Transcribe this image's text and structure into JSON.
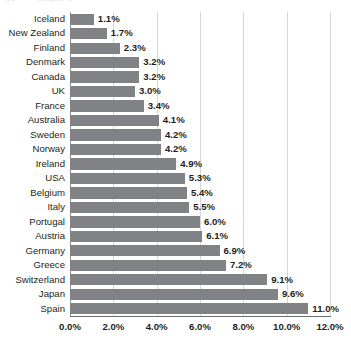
{
  "page": {
    "ghost_header_number": "16",
    "ghost_header_text": "Chapter 2"
  },
  "chart_data": {
    "type": "bar",
    "orientation": "horizontal",
    "title": "",
    "subtitle": "",
    "xlabel": "",
    "ylabel": "",
    "xlim": [
      0,
      12
    ],
    "xtick_labels": [
      "0.0%",
      "2.0%",
      "4.0%",
      "6.0%",
      "8.0%",
      "10.0%",
      "12.0%"
    ],
    "xtick_values": [
      0,
      2,
      4,
      6,
      8,
      10,
      12
    ],
    "grid": "vertical",
    "legend": "none",
    "bar_color": "#808285",
    "gridline_color": "#d5d7d8",
    "axis_color": "#6d7072",
    "value_label_suffix": "%",
    "categories": [
      "Iceland",
      "New Zealand",
      "Finland",
      "Denmark",
      "Canada",
      "UK",
      "France",
      "Australia",
      "Sweden",
      "Norway",
      "Ireland",
      "USA",
      "Belgium",
      "Italy",
      "Portugal",
      "Austria",
      "Germany",
      "Greece",
      "Switzerland",
      "Japan",
      "Spain"
    ],
    "values": [
      1.1,
      1.7,
      2.3,
      3.2,
      3.2,
      3.0,
      3.4,
      4.1,
      4.2,
      4.2,
      4.9,
      5.3,
      5.4,
      5.5,
      6.0,
      6.1,
      6.9,
      7.2,
      9.1,
      9.6,
      11.0
    ],
    "data_labels": [
      "1.1%",
      "1.7%",
      "2.3%",
      "3.2%",
      "3.2%",
      "3.0%",
      "3.4%",
      "4.1%",
      "4.2%",
      "4.2%",
      "4.9%",
      "5.3%",
      "5.4%",
      "5.5%",
      "6.0%",
      "6.1%",
      "6.9%",
      "7.2%",
      "9.1%",
      "9.6%",
      "11.0%"
    ]
  }
}
